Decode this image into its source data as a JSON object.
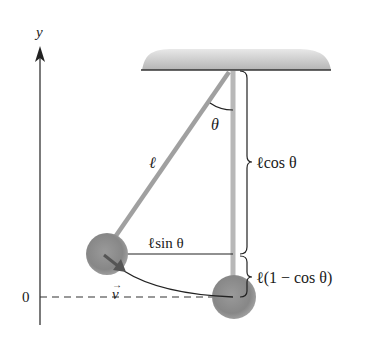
{
  "figure": {
    "type": "physics-diagram",
    "colors": {
      "ceiling_fill": "#c8c8c8",
      "rod": "#a9a9a9",
      "bob": "#8e8e8e",
      "line": "#222222",
      "velocity_arrow": "#555555"
    }
  },
  "labels": {
    "y_axis": "y",
    "origin": "0",
    "angle": "θ",
    "length": "ℓ",
    "horizontal": "ℓsin θ",
    "vertical_top": "ℓcos θ",
    "vertical_bottom": "ℓ(1 − cos θ)",
    "velocity": "v",
    "velocity_arrow_mark": "→"
  }
}
